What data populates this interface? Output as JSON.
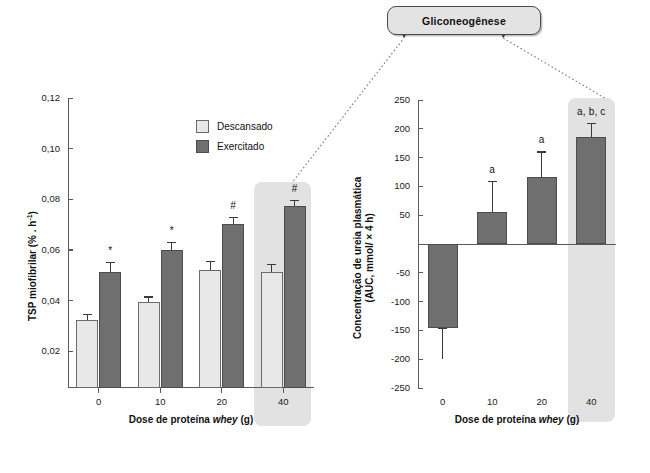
{
  "callout": {
    "label": "Gliconeogênese"
  },
  "legend": {
    "items": [
      {
        "label": "Descansado",
        "color": "#e8e8e8",
        "key": "rested"
      },
      {
        "label": "Exercitado",
        "color": "#6f6f6f",
        "key": "exercised"
      }
    ]
  },
  "chart_data": [
    {
      "id": "tsp-myofibrillar",
      "type": "bar",
      "title": "",
      "xlabel": "Dose de proteína whey (g)",
      "ylabel": "TSP miofibrilar (% . h-1)",
      "ylabel_line1": "TSP miofibrilar (% . h",
      "ylabel_sup": "-1",
      "ylabel_line2": ")",
      "categories": [
        "0",
        "10",
        "20",
        "40"
      ],
      "ytick_labels": [
        "0,02",
        "0,04",
        "0,06",
        "0,08",
        "0,10",
        "0,12"
      ],
      "ytick_values": [
        0.02,
        0.04,
        0.06,
        0.08,
        0.1,
        0.12
      ],
      "ylim": [
        0.0,
        0.12
      ],
      "axis_base": 0.0055,
      "grid": false,
      "legend_position": "top-right",
      "series": [
        {
          "name": "Descansado",
          "values": [
            0.0322,
            0.0395,
            0.0521,
            0.0513
          ],
          "errors": [
            0.0027,
            0.0022,
            0.0037,
            0.0031
          ]
        },
        {
          "name": "Exercitado",
          "values": [
            0.0512,
            0.0601,
            0.0702,
            0.0773
          ],
          "errors": [
            0.004,
            0.003,
            0.0029,
            0.0024
          ]
        }
      ],
      "annotations": [
        {
          "category": "0",
          "text": "*"
        },
        {
          "category": "10",
          "text": "*"
        },
        {
          "category": "20",
          "text": "#"
        },
        {
          "category": "40",
          "text": "#"
        }
      ],
      "highlight_category": "40"
    },
    {
      "id": "plasma-urea-auc",
      "type": "bar",
      "title": "",
      "xlabel": "Dose de proteína whey (g)",
      "ylabel": "Concentração de ureia plasmática (AUC, mmol/ × 4 h)",
      "ylabel_line1": "Concentração de ureia plasmática",
      "ylabel_line2": "(AUC, mmol/ × 4 h)",
      "categories": [
        "0",
        "10",
        "20",
        "40"
      ],
      "ytick_labels": [
        "250",
        "200",
        "150",
        "100",
        "50",
        "-50",
        "-100",
        "-150",
        "-200",
        "-250"
      ],
      "ytick_values": [
        250,
        200,
        150,
        100,
        50,
        -50,
        -100,
        -150,
        -200,
        -250
      ],
      "ylim": [
        -250,
        250
      ],
      "grid": false,
      "legend_position": "none",
      "series": [
        {
          "name": "Exercitado",
          "values": [
            -146,
            55,
            117,
            185
          ],
          "errors": [
            54,
            55,
            44,
            25
          ]
        }
      ],
      "annotations": [
        {
          "category": "10",
          "text": "a"
        },
        {
          "category": "20",
          "text": "a"
        },
        {
          "category": "40",
          "text": "a, b, c"
        }
      ],
      "highlight_category": "40"
    }
  ]
}
